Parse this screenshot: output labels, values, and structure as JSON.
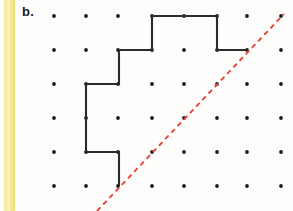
{
  "figure": {
    "panel_label": "b.",
    "background_color": "#fdfdfb",
    "margin_stripe_color": "#f7e88f"
  },
  "lattice": {
    "columns": 7,
    "rows": 6,
    "x_positions": [
      54,
      86,
      118,
      152,
      184,
      217,
      247,
      281
    ],
    "y_positions": [
      16,
      50,
      84,
      118,
      152,
      186
    ],
    "dot_color": "#1d1d1d",
    "dot_radius": 1.9
  },
  "polygon": {
    "name": "staircase-figure",
    "stroke_color": "#2b2b2b",
    "stroke_width": 2.1,
    "closed": false,
    "points": [
      [
        119,
        186
      ],
      [
        119,
        152
      ],
      [
        86,
        152
      ],
      [
        86,
        84
      ],
      [
        119,
        84
      ],
      [
        119,
        50
      ],
      [
        152,
        50
      ],
      [
        152,
        16
      ],
      [
        217,
        16
      ],
      [
        217,
        50
      ],
      [
        247,
        50
      ]
    ]
  },
  "diagonal": {
    "name": "line-of-symmetry",
    "style": "dashed",
    "stroke_color": "#e8443a",
    "stroke_width": 1.9,
    "dash_pattern": "5 4",
    "start": [
      97,
      211
    ],
    "end": [
      284,
      14
    ]
  }
}
